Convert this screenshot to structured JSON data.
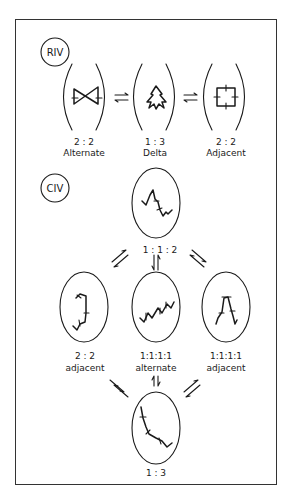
{
  "figure": {
    "colors": {
      "ink": "#1a1a1a",
      "background": "#ffffff"
    },
    "panels": [
      {
        "id": "RIV",
        "tag": "RIV",
        "configurations": [
          {
            "ratio": "2 : 2",
            "name": "Alternate",
            "shape": "bowtie-ring"
          },
          {
            "ratio": "1 : 3",
            "name": "Delta",
            "shape": "tetrahedral-star"
          },
          {
            "ratio": "2 : 2",
            "name": "Adjacent",
            "shape": "square-ring"
          }
        ],
        "equilibria": [
          "Alternate ⇌ Delta",
          "Delta ⇌ Adjacent"
        ]
      },
      {
        "id": "CIV",
        "tag": "CIV",
        "configurations": [
          {
            "ratio": "1 : 1 : 2",
            "name": "",
            "shape": "chain-top"
          },
          {
            "ratio": "2 : 2",
            "name": "adjacent",
            "shape": "chain-folded"
          },
          {
            "ratio": "1:1:1:1",
            "name": "alternate",
            "shape": "chain-zigzag"
          },
          {
            "ratio": "1:1:1:1",
            "name": "adjacent",
            "shape": "chain-arch"
          },
          {
            "ratio": "1 : 3",
            "name": "",
            "shape": "chain-bent"
          }
        ],
        "equilibria": [
          "1:1:2 ⇌ 2:2 adjacent",
          "1:1:2 ⇌ 1:1:1:1 alternate",
          "1:1:2 ⇌ 1:1:1:1 adjacent",
          "2:2 adjacent ⇌ 1:3",
          "1:1:1:1 alternate ⇌ 1:3",
          "1:1:1:1 adjacent ⇌ 1:3"
        ]
      }
    ]
  }
}
